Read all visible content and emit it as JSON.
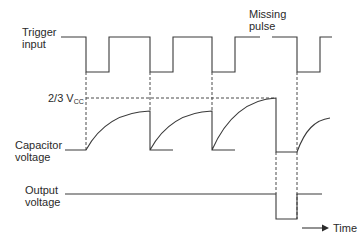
{
  "diagram": {
    "labels": {
      "trigger": [
        "Trigger",
        "input"
      ],
      "missing": [
        "Missing",
        "pulse"
      ],
      "threshold_main": "2/3 V",
      "threshold_sub": "CC",
      "capacitor": [
        "Capacitor",
        "voltage"
      ],
      "output": [
        "Output",
        "voltage"
      ],
      "time_axis": "Time"
    },
    "colors": {
      "stroke": "#3a3a3a",
      "text": "#2a2a2a",
      "background": "#ffffff"
    },
    "signals": {
      "trigger_input": {
        "high_y": 37,
        "low_y": 72,
        "pulses": [
          {
            "fall_x": 86,
            "rise_x": 109
          },
          {
            "fall_x": 150,
            "rise_x": 173
          },
          {
            "fall_x": 212,
            "rise_x": 235
          },
          {
            "fall_x": 297,
            "rise_x": 320
          }
        ],
        "missing_pulse_gap": {
          "x_start": 260,
          "x_end": 272
        }
      },
      "capacitor_voltage": {
        "baseline_y": 150,
        "threshold_y": 98,
        "segments": [
          "charge 86-150",
          "charge 150-212",
          "charge 212-276 reaches threshold",
          "discharge 276",
          "charge 297-330"
        ]
      },
      "output_voltage": {
        "high_y": 194,
        "low_y": 219,
        "low_pulse": {
          "x_start": 276,
          "x_end": 297
        }
      }
    }
  }
}
